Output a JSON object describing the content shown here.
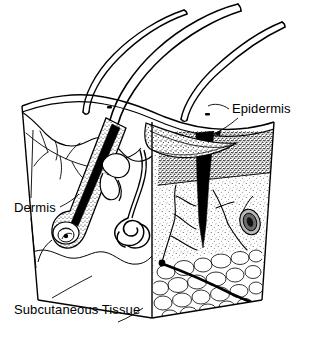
{
  "figure": {
    "width": 315,
    "height": 361,
    "background_color": "#ffffff",
    "ink_color": "#000000",
    "style": "black-and-white line drawing with stipple shading"
  },
  "labels": {
    "epidermis": "Epidermis",
    "dermis": "Dermis",
    "subcutaneous": "Subcutaneous Tissue"
  },
  "structures": {
    "hair_shafts": 3,
    "hair_follicle": "hair follicle with bulb",
    "sebaceous_gland": "sebaceous gland",
    "sweat_gland": "coiled sweat gland",
    "sensory_corpuscle": "sensory corpuscle",
    "blood_vessels": "capillary network",
    "fat_lobules": "subcutaneous fat lobules",
    "surface_pores": 2
  }
}
